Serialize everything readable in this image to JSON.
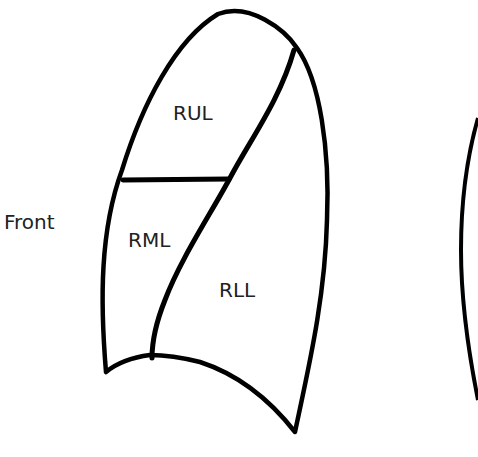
{
  "diagram": {
    "side_label": "Front",
    "lobes": [
      {
        "id": "rul",
        "label": "RUL",
        "name": "Right upper lobe"
      },
      {
        "id": "rml",
        "label": "RML",
        "name": "Right middle lobe"
      },
      {
        "id": "rll",
        "label": "RLL",
        "name": "Right lower lobe"
      }
    ],
    "stroke_color": "#000000",
    "background_color": "#ffffff"
  }
}
